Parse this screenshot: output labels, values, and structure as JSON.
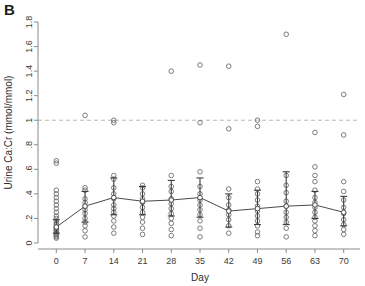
{
  "figure": {
    "panel_label": "B",
    "width": 365,
    "height": 286
  },
  "chart_data": {
    "type": "scatter",
    "title": "",
    "subtitle": "",
    "panel": "B",
    "xlabel": "Day",
    "ylabel": "Urine Ca:Cr (mmol/mmol)",
    "xlim": [
      -3,
      73
    ],
    "ylim": [
      0,
      1.8
    ],
    "xticks": [
      0,
      7,
      14,
      21,
      28,
      35,
      42,
      49,
      56,
      63,
      70
    ],
    "xtick_labels": [
      "0",
      "7",
      "14",
      "21",
      "28",
      "35",
      "42",
      "49",
      "56",
      "63",
      "70"
    ],
    "yticks": [
      0,
      0.2,
      0.4,
      0.6,
      0.8,
      1,
      1.2,
      1.4,
      1.6,
      1.8
    ],
    "ytick_labels": [
      "0",
      ".2",
      ".4",
      ".6",
      ".8",
      "1",
      "1.2",
      "1.4",
      "1.6",
      "1.8"
    ],
    "grid": false,
    "legend": null,
    "legend_position": "none",
    "reference_line": {
      "orientation": "horizontal",
      "value": 1,
      "style": "dashed",
      "color": "#b8b8b8",
      "label": ""
    },
    "marker": {
      "shape": "open-circle",
      "radius": 2.3,
      "color": "#6d6d6d",
      "fill": "none"
    },
    "mean_line": {
      "color": "#4a4a4a",
      "width": 1,
      "marker": "open-circle"
    },
    "error_bars": {
      "style": "capped",
      "color": "#3b3b3b",
      "cap_width": 7,
      "description": "mean with 95% confidence interval / SD whiskers"
    },
    "categories": [
      0,
      7,
      14,
      21,
      28,
      35,
      42,
      49,
      56,
      63,
      70
    ],
    "series": [
      {
        "name": "Mean Urine Ca:Cr",
        "type": "line",
        "x": [
          0,
          7,
          14,
          21,
          28,
          35,
          42,
          49,
          56,
          63,
          70
        ],
        "values": [
          0.13,
          0.3,
          0.37,
          0.34,
          0.35,
          0.37,
          0.26,
          0.28,
          0.3,
          0.31,
          0.25
        ]
      },
      {
        "name": "Error bar lower",
        "type": "errorbar-low",
        "x": [
          0,
          7,
          14,
          21,
          28,
          35,
          42,
          49,
          56,
          63,
          70
        ],
        "values": [
          0.08,
          0.17,
          0.23,
          0.23,
          0.22,
          0.21,
          0.13,
          0.15,
          0.15,
          0.2,
          0.14
        ]
      },
      {
        "name": "Error bar upper",
        "type": "errorbar-high",
        "x": [
          0,
          7,
          14,
          21,
          28,
          35,
          42,
          49,
          56,
          63,
          70
        ],
        "values": [
          0.19,
          0.42,
          0.53,
          0.46,
          0.51,
          0.53,
          0.4,
          0.43,
          0.58,
          0.42,
          0.38
        ]
      },
      {
        "name": "Individual observations",
        "type": "scatter-points",
        "points": [
          {
            "x": 0,
            "y": 0.04
          },
          {
            "x": 0,
            "y": 0.05
          },
          {
            "x": 0,
            "y": 0.06
          },
          {
            "x": 0,
            "y": 0.07
          },
          {
            "x": 0,
            "y": 0.08
          },
          {
            "x": 0,
            "y": 0.09
          },
          {
            "x": 0,
            "y": 0.1
          },
          {
            "x": 0,
            "y": 0.11
          },
          {
            "x": 0,
            "y": 0.12
          },
          {
            "x": 0,
            "y": 0.13
          },
          {
            "x": 0,
            "y": 0.15
          },
          {
            "x": 0,
            "y": 0.16
          },
          {
            "x": 0,
            "y": 0.18
          },
          {
            "x": 0,
            "y": 0.2
          },
          {
            "x": 0,
            "y": 0.22
          },
          {
            "x": 0,
            "y": 0.25
          },
          {
            "x": 0,
            "y": 0.28
          },
          {
            "x": 0,
            "y": 0.31
          },
          {
            "x": 0,
            "y": 0.34
          },
          {
            "x": 0,
            "y": 0.37
          },
          {
            "x": 0,
            "y": 0.4
          },
          {
            "x": 0,
            "y": 0.43
          },
          {
            "x": 0,
            "y": 0.65
          },
          {
            "x": 0,
            "y": 0.67
          },
          {
            "x": 7,
            "y": 0.05
          },
          {
            "x": 7,
            "y": 0.1
          },
          {
            "x": 7,
            "y": 0.14
          },
          {
            "x": 7,
            "y": 0.17
          },
          {
            "x": 7,
            "y": 0.2
          },
          {
            "x": 7,
            "y": 0.24
          },
          {
            "x": 7,
            "y": 0.27
          },
          {
            "x": 7,
            "y": 0.3
          },
          {
            "x": 7,
            "y": 0.33
          },
          {
            "x": 7,
            "y": 0.36
          },
          {
            "x": 7,
            "y": 0.43
          },
          {
            "x": 7,
            "y": 0.45
          },
          {
            "x": 7,
            "y": 1.04
          },
          {
            "x": 14,
            "y": 0.08
          },
          {
            "x": 14,
            "y": 0.13
          },
          {
            "x": 14,
            "y": 0.18
          },
          {
            "x": 14,
            "y": 0.22
          },
          {
            "x": 14,
            "y": 0.25
          },
          {
            "x": 14,
            "y": 0.28
          },
          {
            "x": 14,
            "y": 0.31
          },
          {
            "x": 14,
            "y": 0.36
          },
          {
            "x": 14,
            "y": 0.4
          },
          {
            "x": 14,
            "y": 0.45
          },
          {
            "x": 14,
            "y": 0.52
          },
          {
            "x": 14,
            "y": 0.55
          },
          {
            "x": 14,
            "y": 0.98
          },
          {
            "x": 14,
            "y": 1.0
          },
          {
            "x": 21,
            "y": 0.07
          },
          {
            "x": 21,
            "y": 0.12
          },
          {
            "x": 21,
            "y": 0.17
          },
          {
            "x": 21,
            "y": 0.21
          },
          {
            "x": 21,
            "y": 0.25
          },
          {
            "x": 21,
            "y": 0.29
          },
          {
            "x": 21,
            "y": 0.33
          },
          {
            "x": 21,
            "y": 0.36
          },
          {
            "x": 21,
            "y": 0.4
          },
          {
            "x": 21,
            "y": 0.45
          },
          {
            "x": 21,
            "y": 0.47
          },
          {
            "x": 28,
            "y": 0.06
          },
          {
            "x": 28,
            "y": 0.11
          },
          {
            "x": 28,
            "y": 0.16
          },
          {
            "x": 28,
            "y": 0.2
          },
          {
            "x": 28,
            "y": 0.24
          },
          {
            "x": 28,
            "y": 0.28
          },
          {
            "x": 28,
            "y": 0.32
          },
          {
            "x": 28,
            "y": 0.36
          },
          {
            "x": 28,
            "y": 0.42
          },
          {
            "x": 28,
            "y": 0.46
          },
          {
            "x": 28,
            "y": 0.55
          },
          {
            "x": 28,
            "y": 1.4
          },
          {
            "x": 35,
            "y": 0.05
          },
          {
            "x": 35,
            "y": 0.12
          },
          {
            "x": 35,
            "y": 0.18
          },
          {
            "x": 35,
            "y": 0.23
          },
          {
            "x": 35,
            "y": 0.27
          },
          {
            "x": 35,
            "y": 0.31
          },
          {
            "x": 35,
            "y": 0.35
          },
          {
            "x": 35,
            "y": 0.4
          },
          {
            "x": 35,
            "y": 0.46
          },
          {
            "x": 35,
            "y": 0.58
          },
          {
            "x": 35,
            "y": 0.98
          },
          {
            "x": 35,
            "y": 1.45
          },
          {
            "x": 42,
            "y": 0.08
          },
          {
            "x": 42,
            "y": 0.14
          },
          {
            "x": 42,
            "y": 0.19
          },
          {
            "x": 42,
            "y": 0.23
          },
          {
            "x": 42,
            "y": 0.27
          },
          {
            "x": 42,
            "y": 0.31
          },
          {
            "x": 42,
            "y": 0.37
          },
          {
            "x": 42,
            "y": 0.44
          },
          {
            "x": 42,
            "y": 0.93
          },
          {
            "x": 42,
            "y": 1.44
          },
          {
            "x": 49,
            "y": 0.06
          },
          {
            "x": 49,
            "y": 0.09
          },
          {
            "x": 49,
            "y": 0.14
          },
          {
            "x": 49,
            "y": 0.18
          },
          {
            "x": 49,
            "y": 0.22
          },
          {
            "x": 49,
            "y": 0.26
          },
          {
            "x": 49,
            "y": 0.3
          },
          {
            "x": 49,
            "y": 0.35
          },
          {
            "x": 49,
            "y": 0.4
          },
          {
            "x": 49,
            "y": 0.44
          },
          {
            "x": 49,
            "y": 0.5
          },
          {
            "x": 49,
            "y": 0.95
          },
          {
            "x": 49,
            "y": 1.0
          },
          {
            "x": 56,
            "y": 0.05
          },
          {
            "x": 56,
            "y": 0.12
          },
          {
            "x": 56,
            "y": 0.17
          },
          {
            "x": 56,
            "y": 0.21
          },
          {
            "x": 56,
            "y": 0.25
          },
          {
            "x": 56,
            "y": 0.3
          },
          {
            "x": 56,
            "y": 0.34
          },
          {
            "x": 56,
            "y": 0.41
          },
          {
            "x": 56,
            "y": 0.47
          },
          {
            "x": 56,
            "y": 0.55
          },
          {
            "x": 56,
            "y": 1.7
          },
          {
            "x": 63,
            "y": 0.06
          },
          {
            "x": 63,
            "y": 0.1
          },
          {
            "x": 63,
            "y": 0.14
          },
          {
            "x": 63,
            "y": 0.18
          },
          {
            "x": 63,
            "y": 0.21
          },
          {
            "x": 63,
            "y": 0.25
          },
          {
            "x": 63,
            "y": 0.29
          },
          {
            "x": 63,
            "y": 0.33
          },
          {
            "x": 63,
            "y": 0.37
          },
          {
            "x": 63,
            "y": 0.43
          },
          {
            "x": 63,
            "y": 0.5
          },
          {
            "x": 63,
            "y": 0.55
          },
          {
            "x": 63,
            "y": 0.62
          },
          {
            "x": 63,
            "y": 0.9
          },
          {
            "x": 70,
            "y": 0.07
          },
          {
            "x": 70,
            "y": 0.11
          },
          {
            "x": 70,
            "y": 0.15
          },
          {
            "x": 70,
            "y": 0.19
          },
          {
            "x": 70,
            "y": 0.24
          },
          {
            "x": 70,
            "y": 0.29
          },
          {
            "x": 70,
            "y": 0.35
          },
          {
            "x": 70,
            "y": 0.42
          },
          {
            "x": 70,
            "y": 0.5
          },
          {
            "x": 70,
            "y": 0.88
          },
          {
            "x": 70,
            "y": 1.21
          }
        ]
      }
    ]
  }
}
